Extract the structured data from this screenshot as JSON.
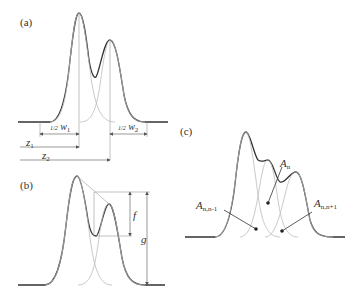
{
  "panels": {
    "a": {
      "label": "(a)",
      "width1": {
        "frac": "1/2",
        "symbol": "w",
        "sub": "1"
      },
      "width2": {
        "frac": "1/2",
        "symbol": "w",
        "sub": "2"
      },
      "pos1": {
        "symbol": "z",
        "sub": "1"
      },
      "pos2": {
        "symbol": "z",
        "sub": "2"
      }
    },
    "b": {
      "label": "(b)",
      "f_label": "f",
      "g_label": "g"
    },
    "c": {
      "label": "(c)",
      "an": {
        "symbol": "A",
        "sub": "n"
      },
      "an_nm1": {
        "symbol": "A",
        "sub": "n,n-1"
      },
      "an_np1": {
        "symbol": "A",
        "sub": "n,n+1"
      }
    }
  },
  "colors": {
    "envelope": "#333333",
    "component": "#bbbbbb",
    "guide": "#999999"
  }
}
